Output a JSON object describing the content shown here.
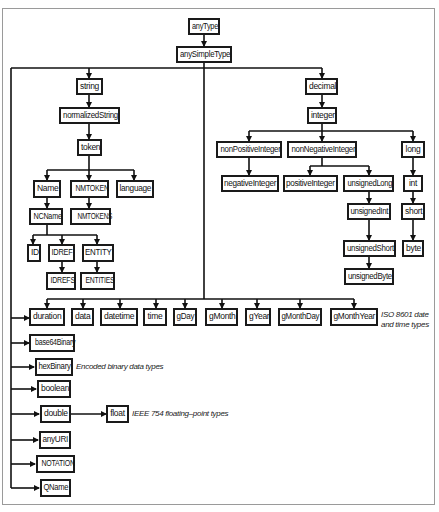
{
  "diagram": {
    "root": "anyType",
    "nodes": {
      "anyType": "anyType",
      "anySimpleType": "anySimpleType",
      "string": "string",
      "normalizedString": "normalizedString",
      "token": "token",
      "Name": "Name",
      "NMTOKEN": "NMTOKEN",
      "language": "language",
      "NCName": "NCName",
      "NMTOKENS": "NMTOKENS",
      "ID": "ID",
      "IDREF": "IDREF",
      "ENTITY": "ENTITY",
      "IDREFS": "IDREFS",
      "ENTITIES": "ENTITIES",
      "decimal": "decimal",
      "integer": "integer",
      "nonPositiveInteger": "nonPositiveInteger",
      "nonNegativeInteger": "nonNegativeInteger",
      "long": "long",
      "negativeInteger": "negativeInteger",
      "positiveInteger": "positiveInteger",
      "unsignedLong": "unsignedLong",
      "int": "int",
      "unsignedInt": "unsignedInt",
      "short": "short",
      "unsignedShort": "unsignedShort",
      "byte": "byte",
      "unsignedByte": "unsignedByte",
      "duration": "duration",
      "data": "data",
      "datetime": "datetime",
      "time": "time",
      "gDay": "gDay",
      "gMonth": "gMonth",
      "gYear": "gYear",
      "gMonthDay": "gMonthDay",
      "gMonthYear": "gMonthYear",
      "base64Binary": "base64Binary",
      "hexBinary": "hexBinary",
      "boolean": "boolean",
      "double": "double",
      "float": "float",
      "anyURI": "anyURI",
      "NOTATION": "NOTATION",
      "QName": "QName"
    },
    "notes": {
      "iso8601_line1": "ISO 8601 date",
      "iso8601_line2": "and time types",
      "binary": "Encoded binary data types",
      "ieee754": "IEEE 754 floating–point types"
    }
  }
}
